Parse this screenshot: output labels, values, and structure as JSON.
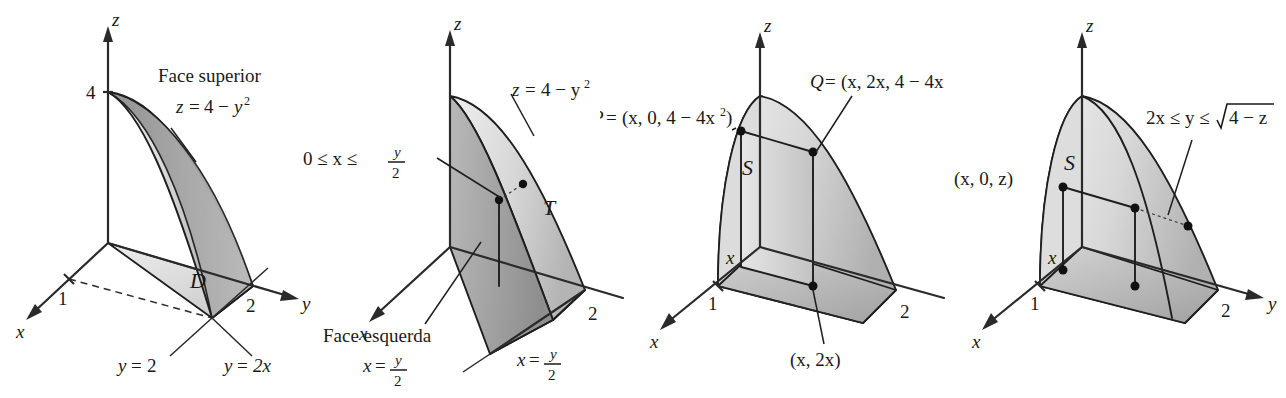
{
  "figure": {
    "panel_count": 4,
    "colors": {
      "ink": "#1a1a1a",
      "line": "#1e1e1e",
      "fill_light": "#e4e4e4",
      "fill_mid": "#c9c9c9",
      "fill_dark": "#a8a8a8",
      "fill_darkest": "#8f8f8f",
      "background": "#ffffff"
    }
  },
  "panels": [
    {
      "id": "panel-1",
      "name": "domain-D",
      "axes": {
        "z": "z",
        "y": "y",
        "x": "x"
      },
      "ticks": {
        "z": "4",
        "y": "2",
        "x": "1"
      },
      "region_label": "D",
      "annotations": [
        {
          "name": "face-superior",
          "line1": "Face superior",
          "line2_lhs": "z",
          "line2_rel": "=",
          "line2_rhs": "4",
          "line2_minus": "−",
          "line2_var": "y",
          "line2_exp": "2",
          "text": "Face superior  z = 4 − y²"
        },
        {
          "name": "y-equals-2",
          "text": "y = 2",
          "lhs": "y",
          "rel": "=",
          "rhs": "2"
        },
        {
          "name": "y-equals-2x",
          "text": "y = 2x",
          "lhs": "y",
          "rel": "=",
          "rhs": "2x"
        }
      ]
    },
    {
      "id": "panel-2",
      "name": "region-T",
      "axes": {
        "z": "z",
        "y": "y",
        "x": "x"
      },
      "ticks": {
        "y": "2"
      },
      "region_label": "T",
      "annotations": [
        {
          "name": "surface-equation",
          "text": "z = 4 − y²",
          "lhs": "z",
          "rel": "=",
          "rhs": "4 − y",
          "exp": "2"
        },
        {
          "name": "x-range",
          "text": "0 ≤ x ≤ y/2",
          "prefix": "0 ≤ x ≤",
          "num": "y",
          "den": "2"
        },
        {
          "name": "face-esquerda",
          "line1": "Face esquerda",
          "line2_lhs": "x",
          "line2_rel": "=",
          "num": "y",
          "den": "2",
          "text": "Face esquerda  x = y/2"
        },
        {
          "name": "plane-x-equals-y-over-2",
          "lhs": "x",
          "rel": "=",
          "num": "y",
          "den": "2",
          "text": "x = y/2"
        }
      ]
    },
    {
      "id": "panel-3",
      "name": "slice-S-vertical",
      "axes": {
        "z": "z",
        "y": "y",
        "x": "x"
      },
      "ticks": {
        "y": "2",
        "x": "1"
      },
      "region_label": "S",
      "edge_label_x": "x",
      "annotations": [
        {
          "name": "point-P",
          "text": "P = (x, 0, 4 − 4x²)",
          "head": "P",
          "rel": "=",
          "body": "(x, 0, 4 − 4x",
          "exp": "2",
          "tail": ")"
        },
        {
          "name": "point-Q",
          "text": "Q = (x, 2x, 4 − 4x²)",
          "head": "Q",
          "rel": "=",
          "body": "(x, 2x, 4 − 4x",
          "exp": "2",
          "tail": ")"
        },
        {
          "name": "point-x-2x",
          "text": "(x, 2x)"
        }
      ]
    },
    {
      "id": "panel-4",
      "name": "slice-S-horizontal",
      "axes": {
        "z": "z",
        "y": "y",
        "x": "x"
      },
      "ticks": {
        "y": "2",
        "x": "1"
      },
      "region_label": "S",
      "edge_label_x": "x",
      "annotations": [
        {
          "name": "y-range",
          "text": "2x ≤ y ≤ √(4 − z)",
          "prefix": "2x ≤ y ≤",
          "radicand": "4 − z"
        },
        {
          "name": "point-x-0-z",
          "text": "(x, 0, z)"
        }
      ]
    }
  ]
}
